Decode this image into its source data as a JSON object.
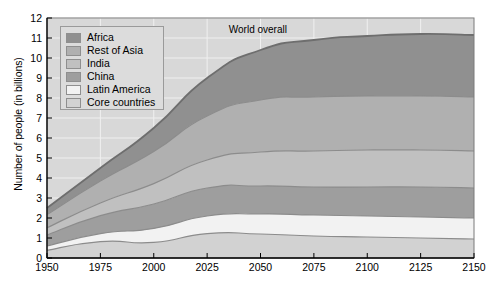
{
  "chart_data": {
    "type": "area",
    "title": "",
    "subtitle": "",
    "xlabel": "",
    "ylabel": "Number of people (in billions)",
    "xlim": [
      1950,
      2150
    ],
    "ylim": [
      0,
      12
    ],
    "xticks": [
      "1950",
      "1975",
      "2000",
      "2025",
      "2050",
      "2075",
      "2100",
      "2125",
      "2150"
    ],
    "yticks": [
      "0",
      "1",
      "2",
      "3",
      "4",
      "5",
      "6",
      "7",
      "8",
      "9",
      "10",
      "11",
      "12"
    ],
    "grid": true,
    "legend_position": "upper-left",
    "stacked": true,
    "annotations": [
      {
        "text": "World overall",
        "x": 2052,
        "y": 11.4
      }
    ],
    "x": [
      1950,
      1975,
      2000,
      2025,
      2050,
      2075,
      2100,
      2125,
      2150
    ],
    "series": [
      {
        "name": "Core countries",
        "color": "#d2d2d2",
        "values": [
          0.38,
          0.82,
          0.78,
          1.22,
          1.2,
          1.1,
          1.05,
          1.0,
          0.95
        ]
      },
      {
        "name": "Latin America",
        "color": "#f2f2f2",
        "values": [
          0.22,
          0.4,
          0.7,
          0.88,
          1.0,
          1.05,
          1.05,
          1.05,
          1.05
        ]
      },
      {
        "name": "China",
        "color": "#9e9e9e",
        "values": [
          0.55,
          0.9,
          1.22,
          1.4,
          1.4,
          1.4,
          1.45,
          1.5,
          1.5
        ]
      },
      {
        "name": "India",
        "color": "#c0c0c0",
        "values": [
          0.36,
          0.63,
          1.02,
          1.4,
          1.7,
          1.8,
          1.85,
          1.85,
          1.85
        ]
      },
      {
        "name": "Rest of Asia",
        "color": "#b0b0b0",
        "values": [
          0.66,
          1.1,
          1.6,
          2.2,
          2.6,
          2.7,
          2.7,
          2.7,
          2.7
        ]
      },
      {
        "name": "Africa",
        "color": "#909090",
        "values": [
          0.33,
          0.65,
          1.18,
          1.9,
          2.5,
          2.85,
          3.0,
          3.1,
          3.1
        ]
      }
    ],
    "totals": [
      2.5,
      4.5,
      6.5,
      9.0,
      10.4,
      10.9,
      11.1,
      11.2,
      11.15
    ]
  },
  "legend": {
    "items": [
      {
        "label": "Africa",
        "color": "#909090"
      },
      {
        "label": "Rest of Asia",
        "color": "#b0b0b0"
      },
      {
        "label": "India",
        "color": "#c0c0c0"
      },
      {
        "label": "China",
        "color": "#9e9e9e"
      },
      {
        "label": "Latin America",
        "color": "#f2f2f2"
      },
      {
        "label": "Core countries",
        "color": "#d2d2d2"
      }
    ]
  },
  "axes": {
    "ylabel": "Number of people (in billions)",
    "yticks": [
      "12",
      "11",
      "10",
      "9",
      "8",
      "7",
      "6",
      "5",
      "4",
      "3",
      "2",
      "1",
      "0"
    ],
    "xticks": [
      "1950",
      "1975",
      "2000",
      "2025",
      "2050",
      "2075",
      "2100",
      "2125",
      "2150"
    ]
  },
  "annotation": {
    "world_overall": "World overall"
  },
  "colors": {
    "plot_background": "#d8d8d8",
    "grid": "#f0f0f0",
    "axis": "#000000",
    "outline": "#7a7a7a"
  }
}
